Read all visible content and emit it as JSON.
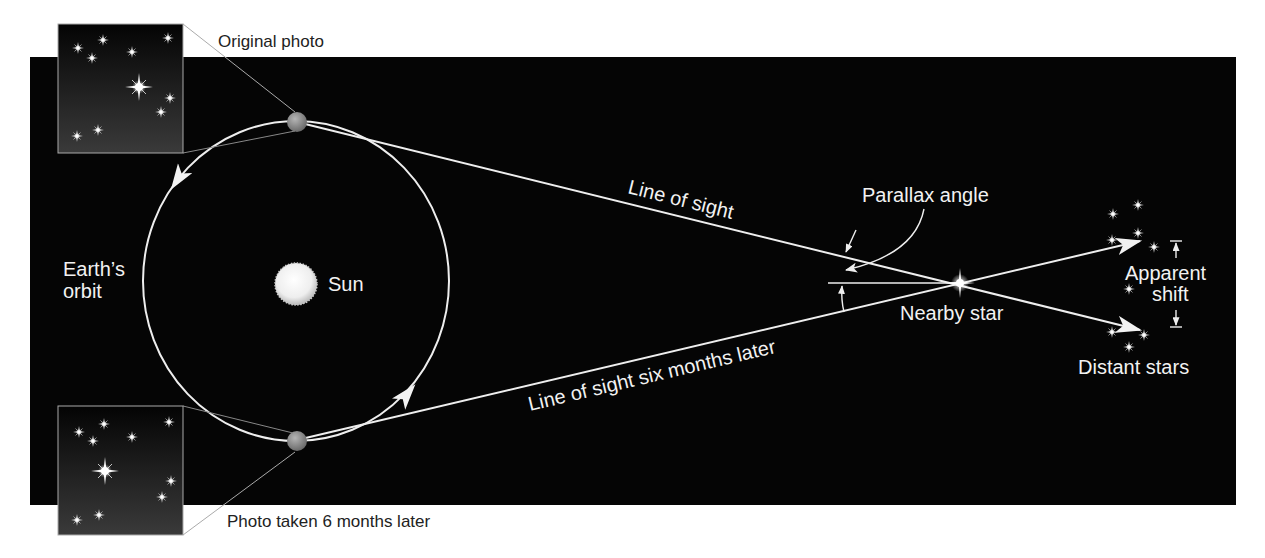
{
  "diagram": {
    "colors": {
      "background": "#ffffff",
      "space": "#050505",
      "line": "#eeeeee",
      "earth": "#8a8a8a",
      "sun": "#f4f4f4",
      "label_dark": "#222222",
      "label_light": "#f2f2f2"
    },
    "labels": {
      "original_photo": "Original photo",
      "photo_later": "Photo taken 6 months later",
      "earths_orbit_line1": "Earth’s",
      "earths_orbit_line2": "orbit",
      "sun": "Sun",
      "line_of_sight": "Line of sight",
      "line_of_sight_later": "Line of sight six months later",
      "parallax_angle": "Parallax angle",
      "nearby_star": "Nearby star",
      "apparent_shift_line1": "Apparent",
      "apparent_shift_line2": "shift",
      "distant_stars": "Distant stars"
    },
    "icons": {
      "earth": "earth-icon",
      "sun": "sun-icon",
      "nearby_star": "star-icon",
      "distant_star": "star-icon",
      "photo": "photo-inset"
    }
  }
}
